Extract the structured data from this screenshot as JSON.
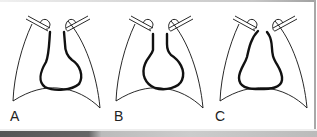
{
  "figure": {
    "panels": [
      {
        "label": "A",
        "offset_x": 0
      },
      {
        "label": "B",
        "offset_x": 103
      },
      {
        "label": "C",
        "offset_x": 207
      }
    ]
  },
  "colors": {
    "line": "#111111",
    "background": "#ffffff",
    "frame": "#a8a8a8"
  }
}
